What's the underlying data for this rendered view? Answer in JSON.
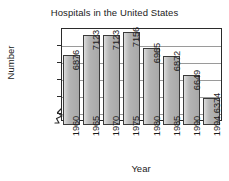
{
  "chart_data": {
    "type": "bar",
    "title": "Hospitals in the United States",
    "xlabel": "Year",
    "ylabel": "Number",
    "categories": [
      "1960",
      "1965",
      "1970",
      "1975",
      "1980",
      "1985",
      "1990",
      "1994"
    ],
    "values": [
      6876,
      7123,
      7123,
      7156,
      6965,
      6872,
      6649,
      6374
    ],
    "value_labels": [
      "6876",
      "7123",
      "7123",
      "7156",
      "6965",
      "6872",
      "6649",
      "6374"
    ],
    "ytick_labels": [
      "7000",
      "6800",
      "6600",
      "6400",
      "6200"
    ],
    "ytick_values": [
      7000,
      6800,
      6600,
      6400,
      6200
    ],
    "ylim": [
      6100,
      7200
    ],
    "axis_break": true,
    "grid": "horizontal",
    "legend": "none",
    "bar_color": "#b3b3b3",
    "bar_border_color": "#3a3a3a",
    "gridline_color": "#9a9a9a",
    "axis_color": "#2b2b2b",
    "text_color": "#1b1b1b",
    "background": "#ffffff"
  }
}
